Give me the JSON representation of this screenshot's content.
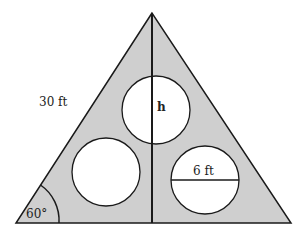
{
  "diagram": {
    "labels": {
      "side": "30 ft",
      "height": "h",
      "diameter": "6 ft",
      "angle": "60°"
    },
    "colors": {
      "fill": "#cfcfcf",
      "stroke": "#1a1a1a",
      "circle_fill": "#ffffff"
    }
  }
}
